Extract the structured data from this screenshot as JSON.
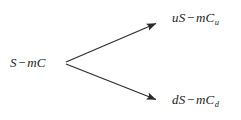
{
  "figure": {
    "type": "binomial-tree-diagram",
    "background_color": "#ffffff",
    "stroke_color": "#2b2b2b",
    "text_color": "#1c1c1c"
  },
  "nodes": {
    "root": {
      "name": "root-node",
      "prefix": "",
      "base": "S",
      "operator": "−",
      "term": "mC",
      "subscript": "",
      "full_text": "S − mC",
      "x": 10,
      "y": 56
    },
    "up": {
      "name": "up-node",
      "prefix": "u",
      "base": "S",
      "operator": "−",
      "term": "mC",
      "subscript": "u",
      "full_text": "uS − mCᵤ",
      "x": 172,
      "y": 11
    },
    "down": {
      "name": "down-node",
      "prefix": "d",
      "base": "S",
      "operator": "−",
      "term": "mC",
      "subscript": "d",
      "full_text": "dS − mCd",
      "x": 172,
      "y": 93
    }
  },
  "edges": [
    {
      "name": "up-branch",
      "from": "root",
      "to": "up",
      "x1": 66,
      "y1": 62,
      "x2": 160,
      "y2": 22
    },
    {
      "name": "down-branch",
      "from": "root",
      "to": "down",
      "x1": 66,
      "y1": 64,
      "x2": 160,
      "y2": 101
    }
  ]
}
